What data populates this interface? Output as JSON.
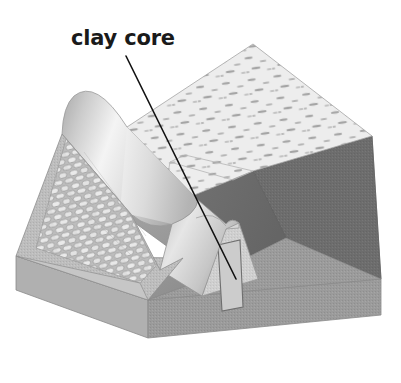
{
  "figure": {
    "kind": "cutaway-isometric-diagram",
    "background_color": "#ffffff"
  },
  "labels": [
    {
      "id": "clay-core",
      "text": "clay core",
      "x": 71,
      "y": 28,
      "color": "#1a1a1a",
      "leader": {
        "from_x": 126,
        "from_y": 56,
        "to_x": 236,
        "to_y": 279,
        "color": "#111111",
        "width": 1.6
      }
    }
  ],
  "parts": {
    "top_fill_surface": {
      "name": "speckled embankment crest surface",
      "fill": "#ededed",
      "speckle_color": "#9c9c9c"
    },
    "riprap_face": {
      "name": "stone riprap upstream facing",
      "fill": "#c4c4c4",
      "stone_color": "#e8e8e8",
      "stone_outline": "#8d8d8d"
    },
    "crest_ridge": {
      "name": "rounded embankment crest ridge",
      "fill_light": "#f0f0f0",
      "fill_mid": "#c9c9c9",
      "fill_dark": "#a8a8a8"
    },
    "clay_core": {
      "name": "clay core wedge",
      "fill": "#cfcfcf",
      "outline": "#8a8a8a",
      "inner_panel_outline": "#7e7e7e"
    },
    "downstream_slope": {
      "name": "downstream slope face",
      "fill": "#9b9b9b"
    },
    "reservoir_face": {
      "name": "dark reservoir / cut face",
      "fill": "#6d6d6d"
    },
    "reservoir_face_shadow": {
      "name": "dark cut face (shaded)",
      "fill": "#636363"
    },
    "base_slab_top": {
      "name": "foundation slab top",
      "fill": "#c3c3c3"
    },
    "base_slab_front": {
      "name": "foundation slab front face",
      "fill": "#b3b3b3"
    },
    "base_slab_right": {
      "name": "foundation slab right face",
      "fill": "#a6a6a6"
    },
    "outline_color": "#7a7a7a"
  },
  "palette": {
    "white": "#ffffff",
    "near_white": "#f2f2f2",
    "light_gray": "#d6d6d6",
    "mid_gray": "#9b9b9b",
    "dark_gray": "#6d6d6d",
    "ink": "#1a1a1a"
  }
}
